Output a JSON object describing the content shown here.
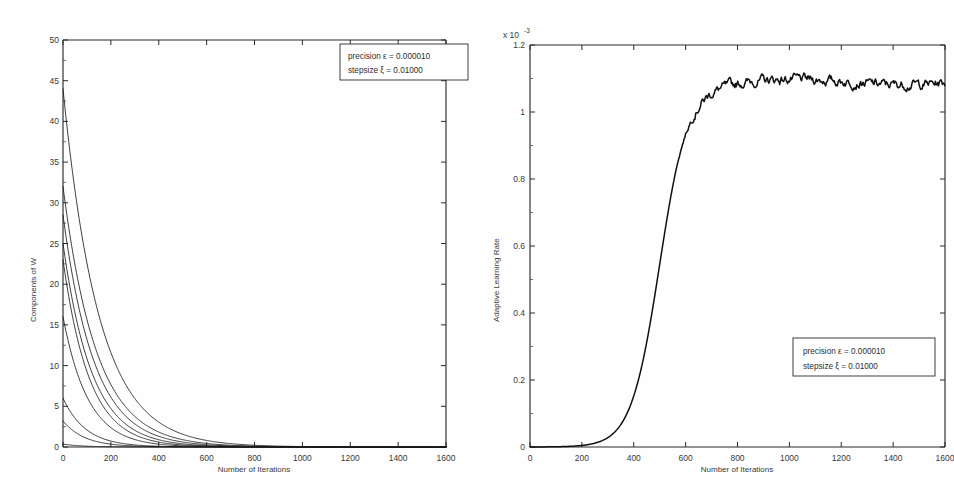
{
  "document": {
    "kind": "scanned-figure-pair",
    "background": "#fefefe"
  },
  "chart_data": [
    {
      "id": "left",
      "type": "line",
      "title": "",
      "xlabel": "Number of Iterations",
      "ylabel": "Components of W",
      "xlim": [
        0,
        1600
      ],
      "ylim": [
        0,
        50
      ],
      "xticks": [
        0,
        200,
        400,
        600,
        800,
        1000,
        1200,
        1400,
        1600
      ],
      "xticklabels": [
        "0",
        "200",
        "400",
        "600",
        "800",
        "1000",
        "1200",
        "1400",
        "1600"
      ],
      "yticks": [
        0,
        5,
        10,
        15,
        20,
        25,
        30,
        35,
        40,
        45,
        50
      ],
      "yticklabels": [
        "0",
        "5",
        "10",
        "15",
        "20",
        "25",
        "30",
        "35",
        "40",
        "45",
        "50"
      ],
      "grid": false,
      "legend_position": "top-right",
      "annotations": [
        "precision ε = 0.000010",
        "stepsize ξ = 0.01000"
      ],
      "series": [
        {
          "name": "w1",
          "initial": 44.0,
          "decay_iterations": 150,
          "values": [
            44.0,
            29.5,
            19.2,
            12.2,
            7.6,
            4.6,
            2.7,
            1.5,
            0.85,
            0.45,
            0.22,
            0.1,
            0.05,
            0.02,
            0.01,
            0.0,
            0.0
          ]
        },
        {
          "name": "w2",
          "initial": 32.0,
          "decay_iterations": 140,
          "values": [
            32.0,
            21.0,
            13.4,
            8.4,
            5.1,
            3.0,
            1.75,
            0.98,
            0.53,
            0.27,
            0.13,
            0.06,
            0.02,
            0.01,
            0.0,
            0.0,
            0.0
          ]
        },
        {
          "name": "w3",
          "initial": 28.5,
          "decay_iterations": 130,
          "values": [
            28.5,
            18.2,
            11.3,
            6.9,
            4.1,
            2.4,
            1.35,
            0.72,
            0.38,
            0.19,
            0.09,
            0.04,
            0.015,
            0.005,
            0.0,
            0.0,
            0.0
          ]
        },
        {
          "name": "w4",
          "initial": 25.0,
          "decay_iterations": 120,
          "values": [
            25.0,
            15.4,
            9.3,
            5.5,
            3.2,
            1.8,
            0.97,
            0.5,
            0.26,
            0.13,
            0.06,
            0.025,
            0.01,
            0.0,
            0.0,
            0.0,
            0.0
          ]
        },
        {
          "name": "w5",
          "initial": 23.0,
          "decay_iterations": 110,
          "values": [
            23.0,
            13.6,
            7.9,
            4.5,
            2.5,
            1.4,
            0.73,
            0.37,
            0.18,
            0.09,
            0.04,
            0.015,
            0.005,
            0.0,
            0.0,
            0.0,
            0.0
          ]
        },
        {
          "name": "w6",
          "initial": 16.0,
          "decay_iterations": 105,
          "values": [
            16.0,
            9.3,
            5.3,
            3.0,
            1.65,
            0.9,
            0.47,
            0.24,
            0.12,
            0.055,
            0.025,
            0.01,
            0.0,
            0.0,
            0.0,
            0.0,
            0.0
          ]
        },
        {
          "name": "w7",
          "initial": 6.0,
          "decay_iterations": 95,
          "values": [
            6.0,
            3.3,
            1.8,
            0.96,
            0.5,
            0.26,
            0.13,
            0.065,
            0.03,
            0.013,
            0.005,
            0.0,
            0.0,
            0.0,
            0.0,
            0.0,
            0.0
          ]
        },
        {
          "name": "w8",
          "initial": 3.2,
          "decay_iterations": 90,
          "values": [
            3.2,
            1.7,
            0.9,
            0.46,
            0.23,
            0.115,
            0.055,
            0.026,
            0.012,
            0.005,
            0.0,
            0.0,
            0.0,
            0.0,
            0.0,
            0.0,
            0.0
          ]
        },
        {
          "name": "w9",
          "initial": 0.35,
          "decay_iterations": 80,
          "values": [
            0.35,
            0.18,
            0.09,
            0.045,
            0.022,
            0.01,
            0.005,
            0.0,
            0.0,
            0.0,
            0.0,
            0.0,
            0.0,
            0.0,
            0.0,
            0.0,
            0.0
          ]
        }
      ],
      "x_sample": [
        0,
        100,
        200,
        300,
        400,
        500,
        600,
        700,
        800,
        900,
        1000,
        1100,
        1200,
        1300,
        1400,
        1500,
        1600
      ]
    },
    {
      "id": "right",
      "type": "line",
      "title": "",
      "xlabel": "Number of Iterations",
      "ylabel": "Adaptive Learning Rate",
      "y_multiplier": "x 10",
      "y_multiplier_exponent": "-3",
      "xlim": [
        0,
        1600
      ],
      "ylim": [
        0,
        1.2
      ],
      "xticks": [
        0,
        200,
        400,
        600,
        800,
        1000,
        1200,
        1400,
        1600
      ],
      "xticklabels": [
        "0",
        "200",
        "400",
        "600",
        "800",
        "1000",
        "1200",
        "1400",
        "1600"
      ],
      "yticks": [
        0,
        0.2,
        0.4,
        0.6,
        0.8,
        1,
        1.2
      ],
      "yticklabels": [
        "0",
        "0.2",
        "0.4",
        "0.6",
        "0.8",
        "1",
        "1.2"
      ],
      "grid": false,
      "legend_position": "bottom-right",
      "annotations": [
        "precision ε = 0.000010",
        "stepsize ξ = 0.01000"
      ],
      "series": [
        {
          "name": "adaptive-learning-rate",
          "plateau_value": 1.09,
          "rise_midpoint": 500,
          "rise_width": 55,
          "x_sample": [
            0,
            100,
            200,
            300,
            350,
            400,
            430,
            460,
            480,
            500,
            520,
            540,
            560,
            580,
            600,
            650,
            700,
            800,
            900,
            1000,
            1100,
            1200,
            1300,
            1400,
            1500,
            1600
          ],
          "values": [
            0.005,
            0.007,
            0.01,
            0.02,
            0.04,
            0.1,
            0.2,
            0.38,
            0.52,
            0.68,
            0.8,
            0.9,
            0.97,
            1.01,
            1.035,
            1.06,
            1.07,
            1.075,
            1.08,
            1.075,
            1.085,
            1.09,
            1.085,
            1.095,
            1.085,
            1.095
          ]
        }
      ]
    }
  ],
  "left_chart": {
    "ylabel": "Components of W",
    "xlabel": "Number of Iterations",
    "legend": {
      "line1": "precision ε = 0.000010",
      "line2": "stepsize ξ = 0.01000"
    }
  },
  "right_chart": {
    "ylabel": "Adaptive Learning Rate",
    "xlabel": "Number of Iterations",
    "multiplier_base": "x 10",
    "multiplier_exp": "-3",
    "legend": {
      "line1": "precision ε = 0.000010",
      "line2": "stepsize ξ = 0.01000"
    }
  }
}
